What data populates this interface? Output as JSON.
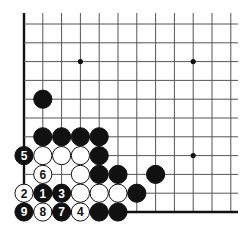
{
  "board": {
    "origin_x": 24,
    "origin_y": 24,
    "step": 18.8,
    "cols": 12,
    "rows": 11,
    "top_extend": 13,
    "right_extend": 238,
    "edges": [
      "left",
      "bottom"
    ],
    "line_color": "#555555",
    "edge_color": "#111111",
    "star_points": [
      [
        3,
        2
      ],
      [
        9,
        2
      ],
      [
        9,
        7
      ]
    ]
  },
  "stones": [
    {
      "col": 1,
      "row": 4,
      "color": "black",
      "label": ""
    },
    {
      "col": 1,
      "row": 6,
      "color": "black",
      "label": ""
    },
    {
      "col": 2,
      "row": 6,
      "color": "black",
      "label": ""
    },
    {
      "col": 3,
      "row": 6,
      "color": "black",
      "label": ""
    },
    {
      "col": 4,
      "row": 6,
      "color": "black",
      "label": ""
    },
    {
      "col": 0,
      "row": 7,
      "color": "black",
      "label": "5"
    },
    {
      "col": 1,
      "row": 7,
      "color": "white",
      "label": ""
    },
    {
      "col": 2,
      "row": 7,
      "color": "white",
      "label": ""
    },
    {
      "col": 3,
      "row": 7,
      "color": "white",
      "label": ""
    },
    {
      "col": 4,
      "row": 7,
      "color": "black",
      "label": ""
    },
    {
      "col": 1,
      "row": 8,
      "color": "white",
      "label": "6"
    },
    {
      "col": 3,
      "row": 8,
      "color": "white",
      "label": ""
    },
    {
      "col": 4,
      "row": 8,
      "color": "black",
      "label": ""
    },
    {
      "col": 5,
      "row": 8,
      "color": "black",
      "label": ""
    },
    {
      "col": 7,
      "row": 8,
      "color": "black",
      "label": ""
    },
    {
      "col": 0,
      "row": 9,
      "color": "white",
      "label": "2"
    },
    {
      "col": 1,
      "row": 9,
      "color": "black",
      "label": "1"
    },
    {
      "col": 2,
      "row": 9,
      "color": "black",
      "label": "3"
    },
    {
      "col": 3,
      "row": 9,
      "color": "white",
      "label": ""
    },
    {
      "col": 4,
      "row": 9,
      "color": "white",
      "label": ""
    },
    {
      "col": 5,
      "row": 9,
      "color": "white",
      "label": ""
    },
    {
      "col": 6,
      "row": 9,
      "color": "black",
      "label": ""
    },
    {
      "col": 0,
      "row": 10,
      "color": "black",
      "label": "9"
    },
    {
      "col": 1,
      "row": 10,
      "color": "white",
      "label": "8"
    },
    {
      "col": 2,
      "row": 10,
      "color": "black",
      "label": "7"
    },
    {
      "col": 3,
      "row": 10,
      "color": "white",
      "label": "4"
    },
    {
      "col": 4,
      "row": 10,
      "color": "black",
      "label": ""
    },
    {
      "col": 5,
      "row": 10,
      "color": "black",
      "label": ""
    }
  ]
}
